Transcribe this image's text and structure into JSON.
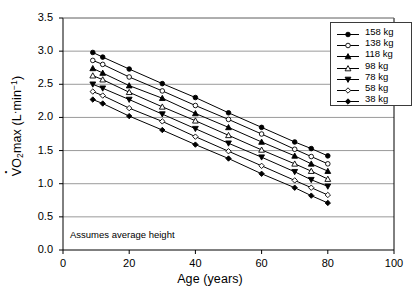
{
  "figure": {
    "background": "#ffffff",
    "frame_color": "#000000",
    "grid_color": "#808080",
    "line_color": "#000000"
  },
  "annotation": "Assumes average height",
  "legend": {
    "position": "top-right",
    "entries": [
      {
        "label": "158 kg",
        "marker": "filled-circle-icon"
      },
      {
        "label": "138 kg",
        "marker": "open-circle-icon"
      },
      {
        "label": "118 kg",
        "marker": "filled-triangle-up-icon"
      },
      {
        "label": "98 kg",
        "marker": "open-triangle-up-icon"
      },
      {
        "label": "78 kg",
        "marker": "filled-triangle-down-icon"
      },
      {
        "label": "58 kg",
        "marker": "open-diamond-icon"
      },
      {
        "label": "38 kg",
        "marker": "filled-diamond-icon"
      }
    ]
  },
  "chart_data": {
    "type": "line",
    "title": "",
    "subtitle": "",
    "xlabel": "Age (years)",
    "ylabel": "VO2max (L·min-1)",
    "ylabel_rich": "V̇O₂max (L·min⁻¹)",
    "xlim": [
      0,
      100
    ],
    "ylim": [
      0.0,
      3.5
    ],
    "xticks": [
      0,
      20,
      40,
      60,
      80,
      100
    ],
    "yticks": [
      0.0,
      0.5,
      1.0,
      1.5,
      2.0,
      2.5,
      3.0,
      3.5
    ],
    "xtick_labels": [
      "0",
      "20",
      "40",
      "60",
      "80",
      "100"
    ],
    "ytick_labels": [
      "0.0",
      "0.5",
      "1.0",
      "1.5",
      "2.0",
      "2.5",
      "3.0",
      "3.5"
    ],
    "grid": "horizontal",
    "legend_position": "upper right",
    "annotations": [
      "Assumes average height"
    ],
    "x": [
      9,
      12,
      20,
      30,
      40,
      50,
      60,
      70,
      75,
      80
    ],
    "series": [
      {
        "name": "158 kg",
        "marker": "filled-circle",
        "values": [
          2.98,
          2.91,
          2.73,
          2.51,
          2.3,
          2.07,
          1.85,
          1.63,
          1.53,
          1.42
        ]
      },
      {
        "name": "138 kg",
        "marker": "open-circle",
        "values": [
          2.86,
          2.8,
          2.61,
          2.4,
          2.18,
          1.97,
          1.75,
          1.52,
          1.41,
          1.3
        ]
      },
      {
        "name": "118 kg",
        "marker": "filled-triangle-up",
        "values": [
          2.74,
          2.67,
          2.48,
          2.29,
          2.06,
          1.85,
          1.63,
          1.42,
          1.3,
          1.19
        ]
      },
      {
        "name": "98 kg",
        "marker": "open-triangle-up",
        "values": [
          2.63,
          2.57,
          2.38,
          2.16,
          1.95,
          1.73,
          1.51,
          1.3,
          1.19,
          1.07
        ]
      },
      {
        "name": "78 kg",
        "marker": "filled-triangle-down",
        "values": [
          2.5,
          2.44,
          2.27,
          2.05,
          1.83,
          1.61,
          1.4,
          1.18,
          1.06,
          0.96
        ]
      },
      {
        "name": "58 kg",
        "marker": "open-diamond",
        "values": [
          2.39,
          2.33,
          2.14,
          1.94,
          1.71,
          1.49,
          1.27,
          1.05,
          0.94,
          0.83
        ]
      },
      {
        "name": "38 kg",
        "marker": "filled-diamond",
        "values": [
          2.27,
          2.21,
          2.02,
          1.81,
          1.59,
          1.38,
          1.15,
          0.94,
          0.82,
          0.71
        ]
      }
    ]
  }
}
